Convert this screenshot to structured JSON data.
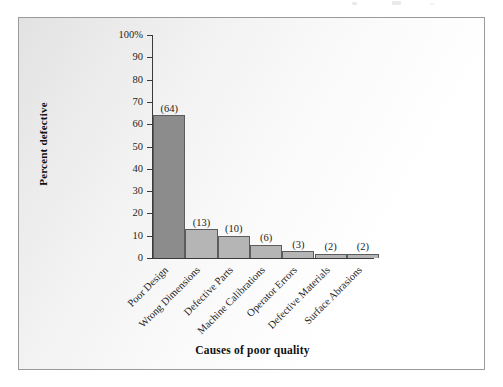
{
  "chart_data": {
    "type": "bar",
    "title": "",
    "subtitle": "",
    "xlabel": "Causes of poor quality",
    "ylabel": "Percent defective",
    "categories": [
      "Poor Design",
      "Wrong Dimensions",
      "Defective Parts",
      "Machine Calibrations",
      "Operator Errors",
      "Defective Materials",
      "Surface Abrasions"
    ],
    "values": [
      64,
      13,
      10,
      6,
      3,
      2,
      2
    ],
    "value_labels": [
      "(64)",
      "(13)",
      "(10)",
      "(6)",
      "(3)",
      "(2)",
      "(2)"
    ],
    "ylim": [
      0,
      100
    ],
    "ytick_values": [
      0,
      10,
      20,
      30,
      40,
      50,
      60,
      70,
      80,
      90,
      100
    ],
    "ytick_labels": [
      "0",
      "10",
      "20",
      "30",
      "40",
      "50",
      "60",
      "70",
      "80",
      "90",
      "100%"
    ],
    "grid": false,
    "legend": null,
    "bar_colors": [
      "#8c8c8c",
      "#b5b5b5",
      "#b5b5b5",
      "#b5b5b5",
      "#b5b5b5",
      "#b5b5b5",
      "#b5b5b5"
    ],
    "bar_border_color": "#5c5c5c",
    "axis_color": "#3a3a3a",
    "frame_border_color": "#9a9a9a",
    "category_label_rotation_deg": -45,
    "bars_contiguous": true
  }
}
